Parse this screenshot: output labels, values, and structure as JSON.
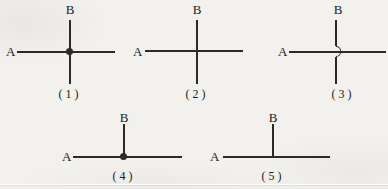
{
  "colors": {
    "line": "#2b2a27",
    "background": "#f2f1ed",
    "text": "#1d1b18"
  },
  "diagrams": [
    {
      "label_left": "A",
      "label_top": "B",
      "caption": "(1)",
      "junction": "connected-crossing-dot"
    },
    {
      "label_left": "A",
      "label_top": "B",
      "caption": "(2)",
      "junction": "unconnected-crossing-plain"
    },
    {
      "label_left": "A",
      "label_top": "B",
      "caption": "(3)",
      "junction": "unconnected-crossing-hop"
    },
    {
      "label_left": "A",
      "label_top": "B",
      "caption": "(4)",
      "junction": "connected-tee-dot"
    },
    {
      "label_left": "A",
      "label_top": "B",
      "caption": "(5)",
      "junction": "unconnected-tee-plain"
    }
  ]
}
